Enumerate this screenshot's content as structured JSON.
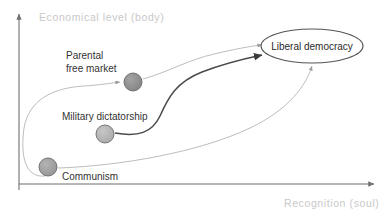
{
  "diagram": {
    "axes": {
      "y_label": "Economical level (body)",
      "x_label": "Recognition (soul)",
      "axis_color": "#6f6f6f",
      "label_color": "#c8c8c8"
    },
    "nodes": [
      {
        "id": "parental-free-market",
        "label_line1": "Parental",
        "label_line2": "free market",
        "label_full": "Parental free market",
        "color": "#8a8a8a",
        "cx": 133,
        "cy": 82,
        "r": 9
      },
      {
        "id": "military-dictatorship",
        "label_line1": "Military dictatorship",
        "label_full": "Military dictatorship",
        "color": "#b0b0b0",
        "cx": 105,
        "cy": 134,
        "r": 9
      },
      {
        "id": "communism",
        "label_line1": "Communism",
        "label_full": "Communism",
        "color": "#9a9a9a",
        "cx": 48,
        "cy": 167,
        "r": 9
      }
    ],
    "ellipse": {
      "id": "liberal-democracy",
      "label": "Liberal democracy",
      "cx": 312,
      "cy": 46,
      "rx": 51,
      "ry": 17,
      "fill": "#ffffff",
      "stroke": "#555555"
    },
    "edges": [
      {
        "id": "communism-to-parental-free-market",
        "from": "communism",
        "to": "parental-free-market",
        "style": "faint",
        "color": "#b4b4b4"
      },
      {
        "id": "parental-free-market-to-liberal-democracy",
        "from": "parental-free-market",
        "to": "liberal-democracy",
        "style": "faint",
        "color": "#b4b4b4"
      },
      {
        "id": "military-dictatorship-to-liberal-democracy",
        "from": "military-dictatorship",
        "to": "liberal-democracy",
        "style": "strong",
        "color": "#4a4a4a"
      },
      {
        "id": "communism-to-liberal-democracy",
        "from": "communism",
        "to": "liberal-democracy",
        "style": "faint",
        "color": "#b4b4b4"
      }
    ]
  }
}
